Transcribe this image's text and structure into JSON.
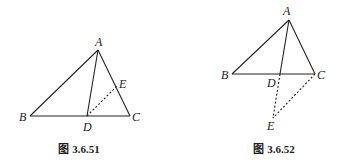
{
  "figures": [
    {
      "caption": "图 3.6.51",
      "points": {
        "A": "A",
        "B": "B",
        "C": "C",
        "D": "D",
        "E": "E"
      }
    },
    {
      "caption": "图 3.6.52",
      "points": {
        "A": "A",
        "B": "B",
        "C": "C",
        "D": "D",
        "E": "E"
      }
    }
  ],
  "colors": {
    "line": "#222222",
    "background": "#ffffff"
  }
}
